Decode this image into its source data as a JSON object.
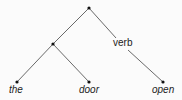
{
  "tree": {
    "internal_label": "verb",
    "leaves": [
      {
        "label": "the"
      },
      {
        "label": "door"
      },
      {
        "label": "open"
      }
    ]
  },
  "colors": {
    "line": "#333333",
    "text": "#222222",
    "background": "#fbfbfb"
  }
}
